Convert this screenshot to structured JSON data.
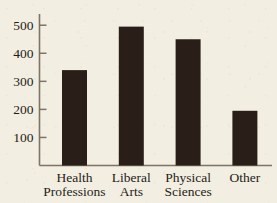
{
  "chart_data": {
    "type": "bar",
    "title": "",
    "subtitle": "",
    "xlabel": "",
    "ylabel": "",
    "categories": [
      "Health Professions",
      "Liberal Arts",
      "Physical Sciences",
      "Other"
    ],
    "category_lines": [
      [
        "Health",
        "Professions"
      ],
      [
        "Liberal",
        "Arts"
      ],
      [
        "Physical",
        "Sciences"
      ],
      [
        "Other"
      ]
    ],
    "values": [
      340,
      495,
      450,
      195
    ],
    "ylim": [
      0,
      540
    ],
    "yticks": [
      100,
      200,
      300,
      400,
      500
    ],
    "ytick_labels": [
      "100",
      "200",
      "300",
      "400",
      "500"
    ],
    "grid": false,
    "legend": null,
    "bar_color": "#2a1f18",
    "axis_color": "#7d7366",
    "text_color": "#241d16",
    "background_color": "#f3eee2"
  },
  "figure": {
    "axis_name": "bar-chart-axes",
    "x_axis_name": "x-axis",
    "y_axis_name": "y-axis"
  }
}
